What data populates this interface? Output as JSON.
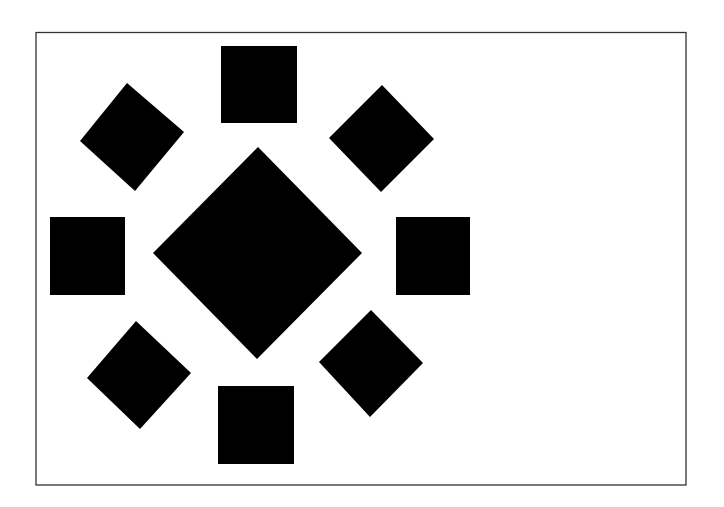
{
  "figure": {
    "background_color": "#ffffff",
    "frame_color": "#333333",
    "shape_color": "#000000",
    "shapes": [
      {
        "id": "top-square",
        "type": "square",
        "position": "top"
      },
      {
        "id": "top-left-diamond",
        "type": "diamond",
        "position": "top-left"
      },
      {
        "id": "top-right-diamond",
        "type": "diamond",
        "position": "top-right"
      },
      {
        "id": "left-square",
        "type": "square",
        "position": "left"
      },
      {
        "id": "center-diamond",
        "type": "diamond",
        "position": "center"
      },
      {
        "id": "right-square",
        "type": "square",
        "position": "right"
      },
      {
        "id": "bottom-left-diamond",
        "type": "diamond",
        "position": "bottom-left"
      },
      {
        "id": "bottom-right-diamond",
        "type": "diamond",
        "position": "bottom-right"
      },
      {
        "id": "bottom-square",
        "type": "square",
        "position": "bottom"
      }
    ]
  }
}
